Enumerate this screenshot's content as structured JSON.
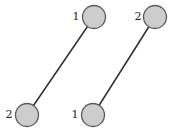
{
  "diagram": {
    "width": 178,
    "height": 139,
    "colors": {
      "background": "#ffffff",
      "edge": "#2e2e2e",
      "node_fill": "#cdcdcd",
      "node_stroke": "#5a5a5a",
      "label": "#1e1e1e"
    },
    "node_radius": 11.5,
    "segments": [
      {
        "name": "left-segment",
        "nodes": [
          {
            "label": "1",
            "cx": 94,
            "cy": 17,
            "label_x": 76,
            "label_y": 16
          },
          {
            "label": "2",
            "cx": 27,
            "cy": 115,
            "label_x": 9,
            "label_y": 114
          }
        ]
      },
      {
        "name": "right-segment",
        "nodes": [
          {
            "label": "2",
            "cx": 155,
            "cy": 17,
            "label_x": 138,
            "label_y": 16
          },
          {
            "label": "1",
            "cx": 93,
            "cy": 115,
            "label_x": 75,
            "label_y": 114
          }
        ]
      }
    ]
  }
}
